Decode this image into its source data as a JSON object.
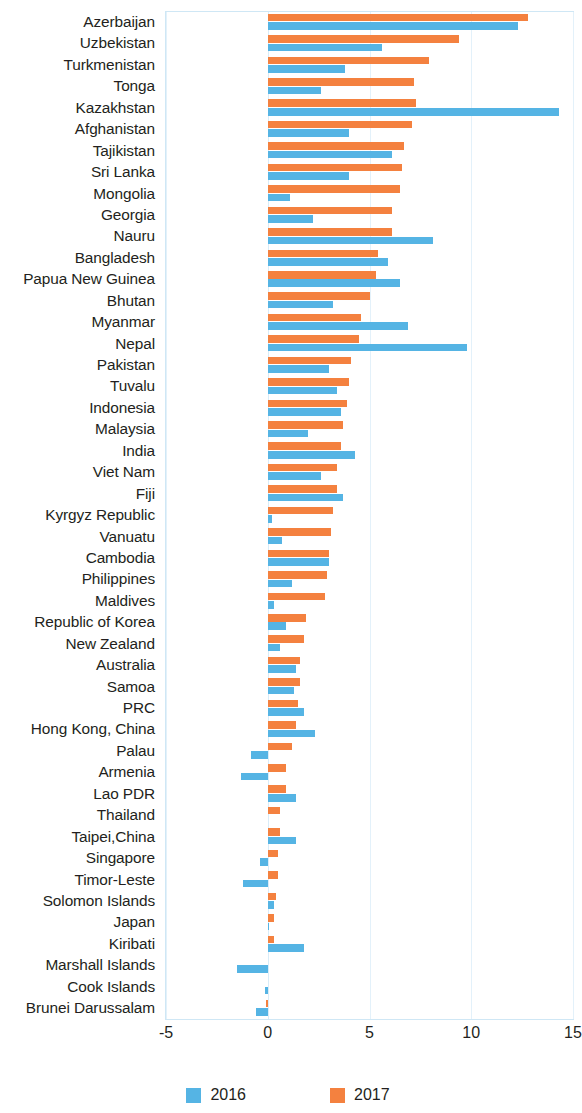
{
  "chart_data": {
    "type": "bar",
    "orientation": "horizontal",
    "title": "",
    "xlabel": "",
    "ylabel": "",
    "xlim": [
      -5,
      15
    ],
    "xticks": [
      -5,
      0,
      5,
      10,
      15
    ],
    "xtick_labels": [
      "-5",
      "0",
      "5",
      "10",
      "15"
    ],
    "grid": true,
    "legend_position": "bottom",
    "colors": {
      "2016": "#55b4e4",
      "2017": "#f4813f"
    },
    "categories": [
      "Azerbaijan",
      "Uzbekistan",
      "Turkmenistan",
      "Tonga",
      "Kazakhstan",
      "Afghanistan",
      "Tajikistan",
      "Sri Lanka",
      "Mongolia",
      "Georgia",
      "Nauru",
      "Bangladesh",
      "Papua New Guinea",
      "Bhutan",
      "Myanmar",
      "Nepal",
      "Pakistan",
      "Tuvalu",
      "Indonesia",
      "Malaysia",
      "India",
      "Viet Nam",
      "Fiji",
      "Kyrgyz Republic",
      "Vanuatu",
      "Cambodia",
      "Philippines",
      "Maldives",
      "Republic of Korea",
      "New Zealand",
      "Australia",
      "Samoa",
      "PRC",
      "Hong Kong, China",
      "Palau",
      "Armenia",
      "Lao PDR",
      "Thailand",
      "Taipei,China",
      "Singapore",
      "Timor-Leste",
      "Solomon Islands",
      "Japan",
      "Kiribati",
      "Marshall Islands",
      "Cook Islands",
      "Brunei Darussalam"
    ],
    "series": [
      {
        "name": "2016",
        "color": "#55b4e4",
        "values": [
          12.3,
          5.6,
          3.8,
          2.6,
          14.3,
          4.0,
          6.1,
          4.0,
          1.1,
          2.2,
          8.1,
          5.9,
          6.5,
          3.2,
          6.9,
          9.8,
          3.0,
          3.4,
          3.6,
          2.0,
          4.3,
          2.6,
          3.7,
          0.2,
          0.7,
          3.0,
          1.2,
          0.3,
          0.9,
          0.6,
          1.4,
          1.3,
          1.8,
          2.3,
          -0.8,
          -1.3,
          1.4,
          0.0,
          1.4,
          -0.4,
          -1.2,
          0.3,
          0.05,
          1.8,
          -1.5,
          -0.15,
          -0.6
        ]
      },
      {
        "name": "2017",
        "color": "#f4813f",
        "values": [
          12.8,
          9.4,
          7.9,
          7.2,
          7.3,
          7.1,
          6.7,
          6.6,
          6.5,
          6.1,
          6.1,
          5.4,
          5.3,
          5.0,
          4.6,
          4.5,
          4.1,
          4.0,
          3.9,
          3.7,
          3.6,
          3.4,
          3.4,
          3.2,
          3.1,
          3.0,
          2.9,
          2.8,
          1.9,
          1.8,
          1.6,
          1.6,
          1.5,
          1.4,
          1.2,
          0.9,
          0.9,
          0.6,
          0.6,
          0.5,
          0.5,
          0.4,
          0.3,
          0.3,
          0.0,
          0.0,
          -0.1
        ]
      }
    ]
  },
  "legend": {
    "items": [
      {
        "label": "2016",
        "color": "#55b4e4",
        "swatch": "legend-swatch-2016"
      },
      {
        "label": "2017",
        "color": "#f4813f",
        "swatch": "legend-swatch-2017"
      }
    ]
  }
}
